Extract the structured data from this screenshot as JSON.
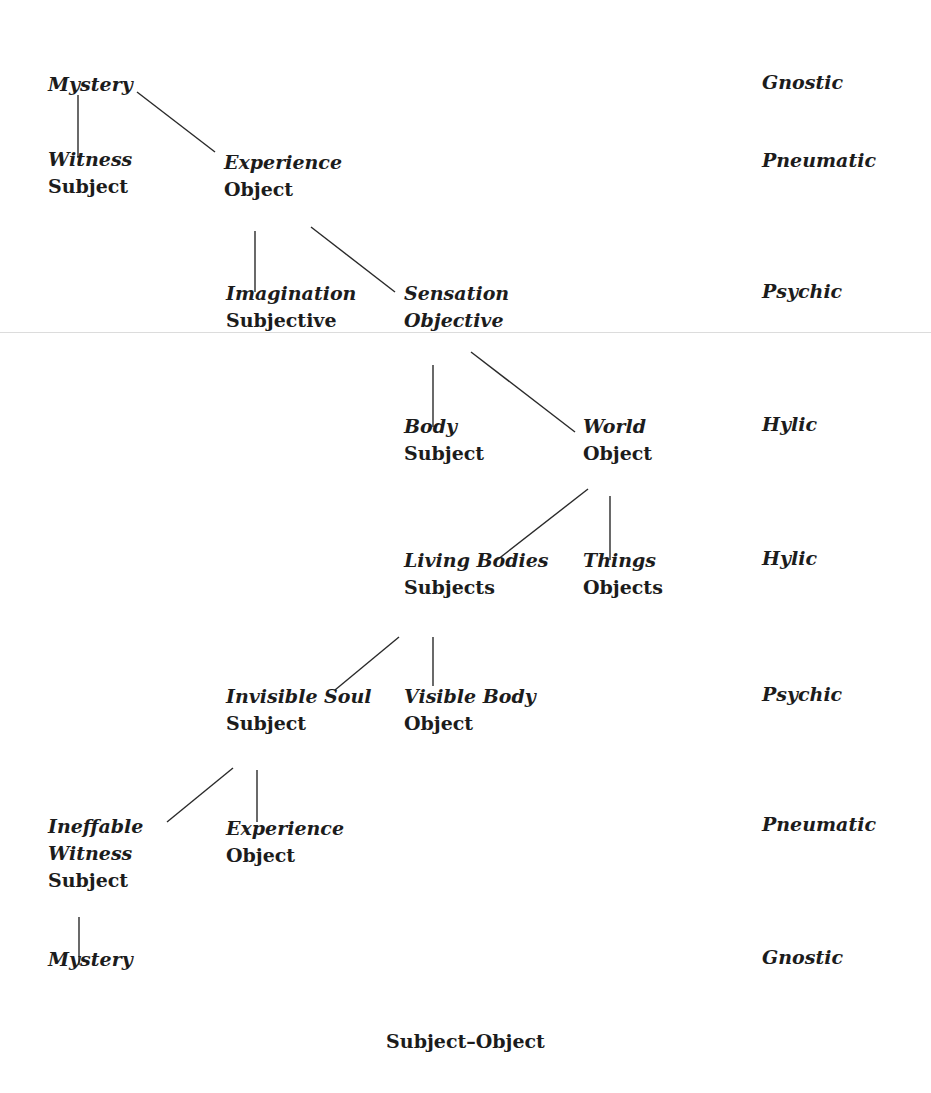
{
  "diagram": {
    "caption": "Subject–Object",
    "nodes": [
      {
        "id": "mystery_top",
        "lines": [
          "Mystery"
        ],
        "styles": [
          "italic"
        ],
        "x": 48,
        "y": 91
      },
      {
        "id": "witness",
        "lines": [
          "Witness",
          "Subject"
        ],
        "styles": [
          "italic",
          "roman"
        ],
        "x": 48,
        "y": 166
      },
      {
        "id": "experience_top",
        "lines": [
          "Experience",
          "Object"
        ],
        "styles": [
          "italic",
          "roman"
        ],
        "x": 224,
        "y": 169
      },
      {
        "id": "imagination",
        "lines": [
          "Imagination",
          "Subjective"
        ],
        "styles": [
          "italic",
          "roman"
        ],
        "x": 226,
        "y": 300
      },
      {
        "id": "sensation",
        "lines": [
          "Sensation",
          "Objective"
        ],
        "styles": [
          "italic",
          "italic"
        ],
        "x": 404,
        "y": 300
      },
      {
        "id": "body",
        "lines": [
          "Body",
          "Subject"
        ],
        "styles": [
          "italic",
          "roman"
        ],
        "x": 404,
        "y": 433
      },
      {
        "id": "world",
        "lines": [
          "World",
          "Object"
        ],
        "styles": [
          "italic",
          "roman"
        ],
        "x": 583,
        "y": 433
      },
      {
        "id": "living_bodies",
        "lines": [
          "Living Bodies",
          "Subjects"
        ],
        "styles": [
          "italic",
          "roman"
        ],
        "x": 404,
        "y": 567
      },
      {
        "id": "things",
        "lines": [
          "Things",
          "Objects"
        ],
        "styles": [
          "italic",
          "roman"
        ],
        "x": 583,
        "y": 567
      },
      {
        "id": "invisible_soul",
        "lines": [
          "Invisible Soul",
          "Subject"
        ],
        "styles": [
          "italic",
          "roman"
        ],
        "x": 226,
        "y": 703
      },
      {
        "id": "visible_body",
        "lines": [
          "Visible Body",
          "Object"
        ],
        "styles": [
          "italic",
          "roman"
        ],
        "x": 404,
        "y": 703
      },
      {
        "id": "ineffable_witness",
        "lines": [
          "Ineffable",
          "Witness",
          "Subject"
        ],
        "styles": [
          "italic",
          "italic",
          "roman"
        ],
        "x": 48,
        "y": 833
      },
      {
        "id": "experience_bottom",
        "lines": [
          "Experience",
          "Object"
        ],
        "styles": [
          "italic",
          "roman"
        ],
        "x": 226,
        "y": 835
      },
      {
        "id": "mystery_bottom",
        "lines": [
          "Mystery"
        ],
        "styles": [
          "italic"
        ],
        "x": 48,
        "y": 966
      }
    ],
    "edges": [
      {
        "from": "mystery_top",
        "to": "witness",
        "x1": 78,
        "y1": 95,
        "x2": 78,
        "y2": 158
      },
      {
        "from": "mystery_top",
        "to": "experience_top",
        "x1": 137,
        "y1": 92,
        "x2": 215,
        "y2": 152
      },
      {
        "from": "experience_top",
        "to": "imagination",
        "x1": 255,
        "y1": 231,
        "x2": 255,
        "y2": 292
      },
      {
        "from": "experience_top",
        "to": "sensation",
        "x1": 311,
        "y1": 227,
        "x2": 395,
        "y2": 292
      },
      {
        "from": "sensation",
        "to": "body",
        "x1": 433,
        "y1": 365,
        "x2": 433,
        "y2": 427
      },
      {
        "from": "sensation",
        "to": "world",
        "x1": 471,
        "y1": 352,
        "x2": 575,
        "y2": 432
      },
      {
        "from": "world",
        "to": "living_bodies",
        "x1": 588,
        "y1": 489,
        "x2": 497,
        "y2": 560
      },
      {
        "from": "world",
        "to": "things",
        "x1": 610,
        "y1": 496,
        "x2": 610,
        "y2": 560
      },
      {
        "from": "living_bodies",
        "to": "invisible_soul",
        "x1": 399,
        "y1": 637,
        "x2": 335,
        "y2": 690
      },
      {
        "from": "living_bodies",
        "to": "visible_body",
        "x1": 433,
        "y1": 637,
        "x2": 433,
        "y2": 686
      },
      {
        "from": "invisible_soul",
        "to": "ineffable_witness",
        "x1": 233,
        "y1": 768,
        "x2": 167,
        "y2": 822
      },
      {
        "from": "invisible_soul",
        "to": "experience_bottom",
        "x1": 257,
        "y1": 770,
        "x2": 257,
        "y2": 822
      },
      {
        "from": "ineffable_witness",
        "to": "mystery_bottom",
        "x1": 79,
        "y1": 917,
        "x2": 79,
        "y2": 965
      }
    ],
    "levels": [
      {
        "label": "Gnostic",
        "y": 91
      },
      {
        "label": "Pneumatic",
        "y": 169
      },
      {
        "label": "Psychic",
        "y": 300
      },
      {
        "label": "Hylic",
        "y": 433
      },
      {
        "label": "Hylic",
        "y": 567
      },
      {
        "label": "Psychic",
        "y": 703
      },
      {
        "label": "Pneumatic",
        "y": 833
      },
      {
        "label": "Gnostic",
        "y": 966
      }
    ]
  }
}
